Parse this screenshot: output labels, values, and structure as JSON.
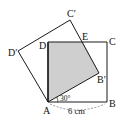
{
  "diagram": {
    "labels": {
      "A": "A",
      "B": "B",
      "C": "C",
      "D": "D",
      "E": "E",
      "B_prime": "B′",
      "C_prime": "C′",
      "D_prime": "D′",
      "angle": "30°",
      "side": "6 cm"
    },
    "colors": {
      "line": "#1a1a1a",
      "shade": "#cfcfcf",
      "background": "#ffffff"
    }
  }
}
